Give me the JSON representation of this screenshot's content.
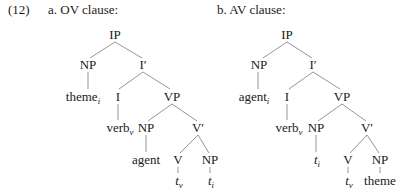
{
  "example": {
    "number": "(12)",
    "a": {
      "heading": "a. OV clause:",
      "nodes": {
        "ip": "IP",
        "np_spec": "NP",
        "i_bar": "I′",
        "theme": "theme",
        "theme_index": "i",
        "i_head": "I",
        "vp": "VP",
        "verb": "verb",
        "verb_index": "v",
        "np_vp": "NP",
        "v_bar": "V′",
        "agent": "agent",
        "v_head": "V",
        "np_obj": "NP",
        "trace_v": "t",
        "trace_v_index": "v",
        "trace_i": "t",
        "trace_i_index": "i"
      }
    },
    "b": {
      "heading": "b. AV clause:",
      "nodes": {
        "ip": "IP",
        "np_spec": "NP",
        "i_bar": "I′",
        "agent": "agent",
        "agent_index": "i",
        "i_head": "I",
        "vp": "VP",
        "verb": "verb",
        "verb_index": "v",
        "np_vp": "NP",
        "v_bar": "V′",
        "trace_i": "t",
        "trace_i_index": "i",
        "v_head": "V",
        "np_obj": "NP",
        "trace_v": "t",
        "trace_v_index": "v",
        "theme": "theme"
      }
    }
  }
}
